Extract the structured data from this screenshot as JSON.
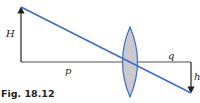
{
  "figure": {
    "caption": "Fig. 18.12",
    "labels": {
      "object_height": "H",
      "object_distance": "p",
      "image_distance": "q",
      "image_height": "h"
    },
    "colors": {
      "ray": "#3b6fc6",
      "lens_fill": "#c9c9cf",
      "lens_stroke": "#3b6fc6",
      "lines": "#222222"
    }
  }
}
